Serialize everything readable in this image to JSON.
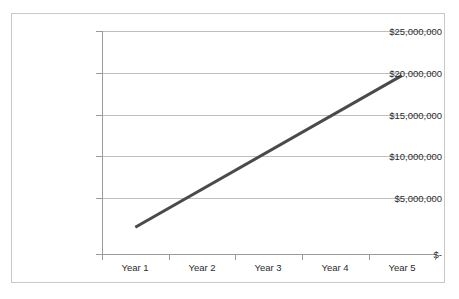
{
  "chart_data": {
    "type": "line",
    "title": "",
    "xlabel": "",
    "ylabel": "",
    "categories": [
      "Year 1",
      "Year 2",
      "Year 3",
      "Year 4",
      "Year 5"
    ],
    "series": [
      {
        "name": "Revenue",
        "values": [
          3000000,
          7250000,
          11500000,
          15750000,
          20000000
        ],
        "color": "#4a4a4a",
        "line_width": 3
      }
    ],
    "ylim": [
      0,
      25000000
    ],
    "ytick_values": [
      0,
      5000000,
      10000000,
      15000000,
      20000000,
      25000000
    ],
    "ytick_labels": [
      "$-",
      "$5,000,000",
      "$10,000,000",
      "$15,000,000",
      "$20,000,000",
      "$25,000,000"
    ],
    "grid": true,
    "grid_color": "#bfbfbf",
    "legend": false,
    "legend_position": "none",
    "axis_color": "#9a9a9a",
    "border_color": "#c9c9c9",
    "background": "#ffffff"
  },
  "axis": {
    "y_labels": [
      {
        "text": "$25,000,000",
        "value": 25000000
      },
      {
        "text": "$20,000,000",
        "value": 20000000
      },
      {
        "text": "$15,000,000",
        "value": 15000000
      },
      {
        "text": "$10,000,000",
        "value": 10000000
      },
      {
        "text": "$5,000,000",
        "value": 5000000
      },
      {
        "text": "$-",
        "value": 0
      }
    ],
    "x_labels": [
      {
        "text": "Year 1"
      },
      {
        "text": "Year 2"
      },
      {
        "text": "Year 3"
      },
      {
        "text": "Year 4"
      },
      {
        "text": "Year 5"
      }
    ]
  }
}
